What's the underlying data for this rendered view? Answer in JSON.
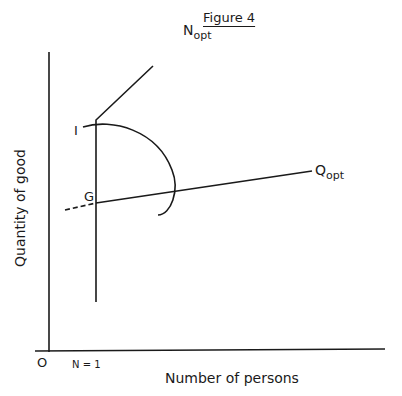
{
  "figure": {
    "title": "Figure 4",
    "x_axis_label": "Number of persons",
    "y_axis_label": "Quantity of good",
    "origin_label": "O",
    "n1_label": "N = 1",
    "curves": {
      "n_opt": {
        "main": "N",
        "sub": "opt"
      },
      "q_opt": {
        "main": "Q",
        "sub": "opt"
      }
    },
    "points": {
      "i": "I",
      "g": "G"
    },
    "line_color": "#1a1a1a",
    "background": "#ffffff"
  }
}
